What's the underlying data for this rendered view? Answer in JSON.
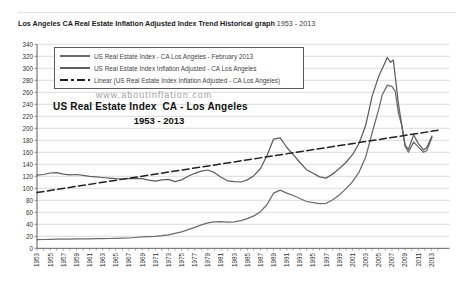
{
  "page": {
    "title_bold": "Los Angeles CA Real Estate Inflation Adjusted Index Trend Historical graph",
    "title_range": " 1953 - 2013",
    "watermark": "www.aboutinflation.com"
  },
  "colors": {
    "grid": "#cbcbcb",
    "axis": "#5f5f5f",
    "tick_label": "#333333",
    "background": "#ffffff"
  },
  "chart_data": {
    "type": "line",
    "title": "US Real Estate Index  CA - Los Angeles",
    "subtitle": "1953 - 2013",
    "xlabel": "",
    "ylabel": "",
    "xlim": [
      1953,
      2014.5
    ],
    "ylim": [
      0,
      340
    ],
    "grid": "horizontal",
    "legend_position": "top-left",
    "y_ticks": [
      0,
      20,
      40,
      60,
      80,
      100,
      120,
      140,
      160,
      180,
      200,
      220,
      240,
      260,
      280,
      300,
      320,
      340
    ],
    "x_tick_labels": [
      "1953",
      "1955",
      "1957",
      "1959",
      "1961",
      "1963",
      "1965",
      "1967",
      "1969",
      "1971",
      "1973",
      "1975",
      "1977",
      "1979",
      "1981",
      "1983",
      "1985",
      "1987",
      "1989",
      "1991",
      "1993",
      "1995",
      "1997",
      "1999",
      "2001",
      "2003",
      "2005",
      "2007",
      "2009",
      "2011",
      "2013"
    ],
    "series": [
      {
        "name": "US Real Estate Index - CA Los Angeles - February 2013",
        "style": "solid",
        "color": "#6b6b6b",
        "points": [
          [
            1953,
            14.5
          ],
          [
            1954,
            14.7
          ],
          [
            1955,
            15
          ],
          [
            1956,
            15.3
          ],
          [
            1957,
            15.3
          ],
          [
            1958,
            15.4
          ],
          [
            1959,
            15.6
          ],
          [
            1960,
            15.8
          ],
          [
            1961,
            15.9
          ],
          [
            1962,
            16
          ],
          [
            1963,
            16.1
          ],
          [
            1964,
            16.3
          ],
          [
            1965,
            16.5
          ],
          [
            1966,
            16.8
          ],
          [
            1967,
            17.2
          ],
          [
            1968,
            18
          ],
          [
            1969,
            19
          ],
          [
            1970,
            19.5
          ],
          [
            1971,
            20
          ],
          [
            1972,
            21
          ],
          [
            1973,
            22.5
          ],
          [
            1974,
            25
          ],
          [
            1975,
            27.5
          ],
          [
            1976,
            31
          ],
          [
            1977,
            35
          ],
          [
            1978,
            39
          ],
          [
            1979,
            42.5
          ],
          [
            1980,
            44
          ],
          [
            1981,
            44.5
          ],
          [
            1982,
            43.5
          ],
          [
            1983,
            44
          ],
          [
            1984,
            46
          ],
          [
            1985,
            49.5
          ],
          [
            1986,
            54
          ],
          [
            1987,
            61
          ],
          [
            1988,
            73
          ],
          [
            1989,
            92
          ],
          [
            1990,
            97
          ],
          [
            1991,
            92
          ],
          [
            1992,
            88
          ],
          [
            1993,
            83
          ],
          [
            1994,
            78
          ],
          [
            1995,
            76
          ],
          [
            1996,
            74.5
          ],
          [
            1997,
            75
          ],
          [
            1998,
            81
          ],
          [
            1999,
            89
          ],
          [
            2000,
            99
          ],
          [
            2001,
            111
          ],
          [
            2002,
            127
          ],
          [
            2003,
            152
          ],
          [
            2004,
            193
          ],
          [
            2005,
            232
          ],
          [
            2005.5,
            255
          ],
          [
            2006.3,
            272
          ],
          [
            2007,
            270
          ],
          [
            2007.5,
            262
          ],
          [
            2008,
            225
          ],
          [
            2008.5,
            205
          ],
          [
            2009,
            170
          ],
          [
            2009.5,
            160
          ],
          [
            2010.3,
            177
          ],
          [
            2011,
            169
          ],
          [
            2011.8,
            160
          ],
          [
            2012.3,
            163
          ],
          [
            2013.1,
            185
          ]
        ]
      },
      {
        "name": "US Real Estate Index Inflation Adjusted - CA Los Angeles",
        "style": "solid",
        "color": "#5e5e5e",
        "points": [
          [
            1953,
            122
          ],
          [
            1954,
            123
          ],
          [
            1955,
            125.5
          ],
          [
            1956,
            126
          ],
          [
            1957,
            123.5
          ],
          [
            1958,
            122.5
          ],
          [
            1959,
            123
          ],
          [
            1960,
            121.5
          ],
          [
            1961,
            120
          ],
          [
            1962,
            119
          ],
          [
            1963,
            118
          ],
          [
            1964,
            117
          ],
          [
            1965,
            116
          ],
          [
            1966,
            115.5
          ],
          [
            1967,
            116
          ],
          [
            1968,
            116.5
          ],
          [
            1969,
            116
          ],
          [
            1970,
            113.5
          ],
          [
            1971,
            112
          ],
          [
            1972,
            114
          ],
          [
            1973,
            115
          ],
          [
            1974,
            111
          ],
          [
            1975,
            114
          ],
          [
            1976,
            120
          ],
          [
            1977,
            125
          ],
          [
            1978,
            128.5
          ],
          [
            1979,
            130.5
          ],
          [
            1980,
            126
          ],
          [
            1981,
            118.5
          ],
          [
            1982,
            112.5
          ],
          [
            1983,
            111
          ],
          [
            1984,
            110.5
          ],
          [
            1985,
            114
          ],
          [
            1986,
            121
          ],
          [
            1987,
            133
          ],
          [
            1988,
            155
          ],
          [
            1989,
            182
          ],
          [
            1990,
            184
          ],
          [
            1991,
            168
          ],
          [
            1992,
            156
          ],
          [
            1993,
            143
          ],
          [
            1994,
            131
          ],
          [
            1995,
            125
          ],
          [
            1996,
            119
          ],
          [
            1997,
            117
          ],
          [
            1998,
            124
          ],
          [
            1999,
            133
          ],
          [
            2000,
            143
          ],
          [
            2001,
            156
          ],
          [
            2002,
            175
          ],
          [
            2003,
            205
          ],
          [
            2004,
            254
          ],
          [
            2005,
            287
          ],
          [
            2005.5,
            299
          ],
          [
            2006.3,
            318
          ],
          [
            2006.8,
            310
          ],
          [
            2007.2,
            314
          ],
          [
            2008,
            240
          ],
          [
            2008.5,
            205
          ],
          [
            2009,
            172
          ],
          [
            2009.5,
            165
          ],
          [
            2010.3,
            189
          ],
          [
            2011,
            175
          ],
          [
            2011.8,
            164
          ],
          [
            2012.3,
            168
          ],
          [
            2013.1,
            187
          ]
        ]
      },
      {
        "name": "Linear (US Real Estate Index Inflation Adjusted - CA Los Angeles)",
        "style": "dashed",
        "color": "#222222",
        "points": [
          [
            1953,
            93
          ],
          [
            2014,
            196.7
          ]
        ]
      }
    ]
  }
}
